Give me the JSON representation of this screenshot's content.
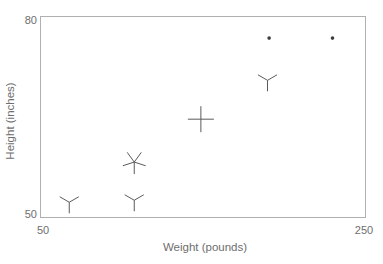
{
  "figure": {
    "background": "#ffffff",
    "frame_color": "#b0b0b0",
    "glyph_color": "#5a5a5a",
    "dot_color": "#3d3d3d",
    "text_color": "#6e6e6e"
  },
  "chart_data": {
    "type": "scatter",
    "variant": "sunflower-glyph",
    "title": "",
    "xlabel": "Weight (pounds)",
    "ylabel": "Height (inches)",
    "xlim": [
      50,
      250
    ],
    "ylim": [
      50,
      80
    ],
    "x_ticks": [
      50,
      250
    ],
    "y_ticks": [
      50,
      80
    ],
    "x_tick_labels": [
      "50",
      "250"
    ],
    "y_tick_labels": [
      "50",
      "80"
    ],
    "grid": false,
    "legend_position": "none",
    "points": [
      {
        "x": 68,
        "y": 52.2,
        "petals": 3,
        "ray_px": 11
      },
      {
        "x": 108,
        "y": 52.5,
        "petals": 3,
        "ray_px": 11
      },
      {
        "x": 108,
        "y": 58.2,
        "petals": 5,
        "ray_px": 12
      },
      {
        "x": 149,
        "y": 64.6,
        "petals": 4,
        "ray_px": 13
      },
      {
        "x": 190,
        "y": 70.4,
        "petals": 3,
        "ray_px": 11
      },
      {
        "x": 191,
        "y": 76.7,
        "petals": 1,
        "ray_px": 2
      },
      {
        "x": 230,
        "y": 76.7,
        "petals": 1,
        "ray_px": 2
      }
    ]
  }
}
